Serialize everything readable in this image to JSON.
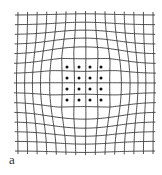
{
  "figure": {
    "panel_label": "a",
    "colors": {
      "line": "#3a3a3a",
      "dot": "#111111",
      "background": "#ffffff"
    },
    "grid": {
      "x_start": 18,
      "x_end": 153,
      "y_start": 15,
      "y_end": 151,
      "vertical_lines": 15,
      "horizontal_lines": 15,
      "center": [
        84,
        84
      ],
      "bulge_radius": 28,
      "bulge_strength": 7,
      "line_width": 0.9
    },
    "dots": {
      "xs": [
        67,
        79,
        90,
        101
      ],
      "ys": [
        67,
        78,
        89,
        100
      ],
      "radius": 1.5
    }
  }
}
